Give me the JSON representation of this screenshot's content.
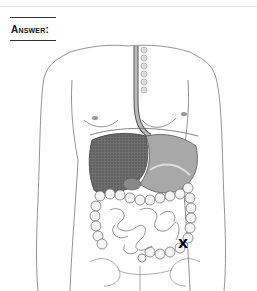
{
  "worksheet": {
    "answer_label": "Answer:",
    "figure": {
      "subject": "human digestive system illustration",
      "icon": "anatomy-torso-illustration",
      "marker": {
        "symbol": "X",
        "location": "lower left abdomen (descending / sigmoid colon)",
        "x": 184,
        "y": 244
      }
    }
  }
}
